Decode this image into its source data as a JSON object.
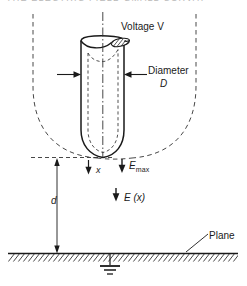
{
  "figure": {
    "labels": {
      "voltage": "Voltage V",
      "diameter": "Diameter",
      "diameter_symbol": "D",
      "x": "x",
      "e_max": "E",
      "e_max_subscript": "max",
      "e_of_x": "E (x)",
      "gap_distance": "d",
      "plane": "Plane"
    },
    "cropped_header_text": "THE ELECTRIC FIELD   SMALL CURVAT",
    "colors": {
      "ink": "#1a1a1a",
      "background": "#ffffff",
      "hatch": "#333333",
      "dashed": "#333333",
      "faint_header": "#b9b9b9"
    },
    "elements": {
      "rod": "vertical cylinder electrode with hatched cut top face, dashed inner bore outline and dash-dot axis",
      "equipotential": "large dashed U-shaped (parabolic) equipotential curve enclosing rod tip",
      "tip_reference_line": "horizontal dashed datum line through rod tip",
      "ground_plane": "solid horizontal line with diagonal hatching below",
      "earth_symbol": "three decreasing horizontal bars below plane",
      "arrows": [
        "right-pointing diameter arrow on left flank of rod",
        "left-pointing diameter arrow on right flank of rod",
        "downward arrow for x from tip datum",
        "downward arrow for E max at tip",
        "downward arrow for E (x) in gap",
        "double-headed vertical dimension arrow for d"
      ]
    }
  }
}
